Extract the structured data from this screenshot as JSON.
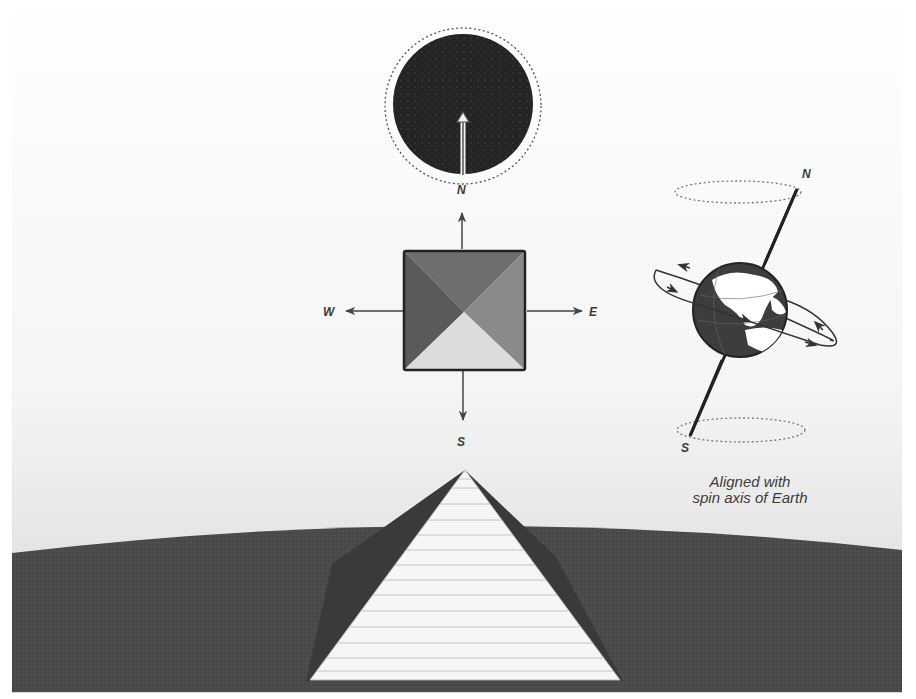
{
  "diagram": {
    "colors": {
      "sky_top": "#ffffff",
      "sky_bottom": "#dcdcdc",
      "ground": "#4a4a4a",
      "star_disc": "#232323",
      "pyramid_face": "#f6f6f6",
      "pyramid_side": "#3a3a3a",
      "top_view_north": "#6e6e6e",
      "top_view_west": "#5a5a5a",
      "top_view_east": "#8a8a8a",
      "top_view_south": "#dadada",
      "line": "#444444"
    },
    "compass": {
      "north_label": "N",
      "south_label": "S",
      "east_label": "E",
      "west_label": "W"
    },
    "earth_axis": {
      "north_label": "N",
      "south_label": "S"
    },
    "caption": {
      "line1": "Aligned with",
      "line2": "spin axis of Earth"
    },
    "elements": {
      "celestial_pole_disc": "dark starfield circle with dotted ring",
      "pyramid_top_view": "square divided into four triangular faces",
      "pyramid_side_view": "white stepped pyramid on dark horizon",
      "earth_globe": "globe with tilted rotation axis and spin orbit arrows"
    }
  }
}
